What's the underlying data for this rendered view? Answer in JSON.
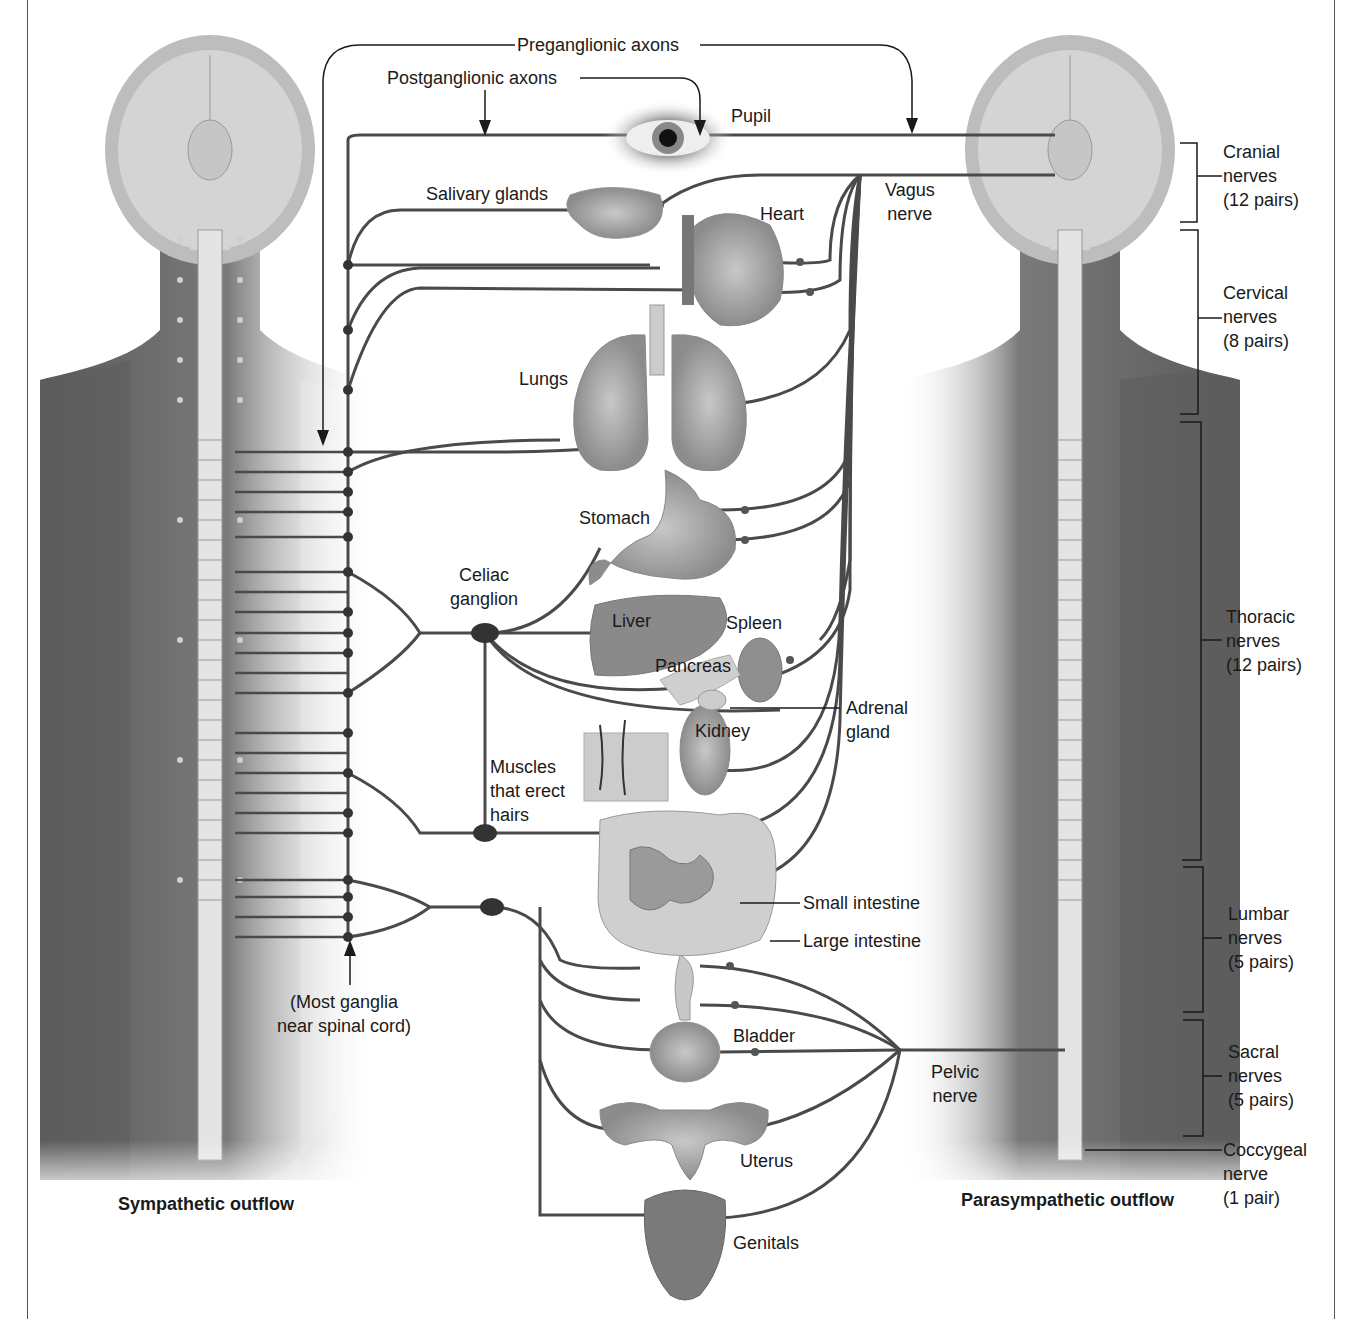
{
  "figure": {
    "sympathetic_title": "Sympathetic outflow",
    "parasympathetic_title": "Parasympathetic outflow"
  },
  "labels": {
    "preganglionic": "Preganglionic axons",
    "postganglionic": "Postganglionic axons",
    "pupil": "Pupil",
    "salivary": "Salivary glands",
    "heart": "Heart",
    "vagus": "Vagus\nnerve",
    "lungs": "Lungs",
    "stomach": "Stomach",
    "celiac": "Celiac\nganglion",
    "liver": "Liver",
    "spleen": "Spleen",
    "pancreas": "Pancreas",
    "adrenal": "Adrenal\ngland",
    "kidney": "Kidney",
    "muscles": "Muscles\nthat erect\nhairs",
    "small_intestine": "Small intestine",
    "large_intestine": "Large intestine",
    "most_ganglia": "(Most ganglia\nnear spinal cord)",
    "bladder": "Bladder",
    "pelvic": "Pelvic\nnerve",
    "uterus": "Uterus",
    "genitals": "Genitals"
  },
  "spinal_regions": [
    {
      "name": "Cranial",
      "text": "Cranial\nnerves\n(12 pairs)"
    },
    {
      "name": "Cervical",
      "text": "Cervical\nnerves\n(8 pairs)"
    },
    {
      "name": "Thoracic",
      "text": "Thoracic\nnerves\n(12 pairs)"
    },
    {
      "name": "Lumbar",
      "text": "Lumbar\nnerves\n(5 pairs)"
    },
    {
      "name": "Sacral",
      "text": "Sacral\nnerves\n(5 pairs)"
    },
    {
      "name": "Coccygeal",
      "text": "Coccygeal\nnerve\n(1 pair)"
    }
  ],
  "colors": {
    "nerve": "#4a4a4a",
    "body": "#6e6e6e",
    "head": "#bdbdbd",
    "organ": "#9a9a9a"
  }
}
